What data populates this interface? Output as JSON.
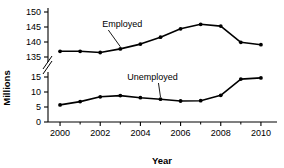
{
  "chart_data": {
    "type": "line",
    "title": "",
    "xlabel": "Year",
    "ylabel": "Millions",
    "grid": false,
    "legend_position": "inline-annotation",
    "x": [
      2000,
      2001,
      2002,
      2003,
      2004,
      2005,
      2006,
      2007,
      2008,
      2009,
      2010
    ],
    "xtick_labels": [
      "2000",
      "2002",
      "2004",
      "2006",
      "2008",
      "2010"
    ],
    "xtick_values": [
      2000,
      2002,
      2004,
      2006,
      2008,
      2010
    ],
    "xminor_values": [
      2001,
      2003,
      2005,
      2007,
      2009
    ],
    "xlim": [
      1999.4,
      2010.8
    ],
    "axis_break": true,
    "axis_break_between": [
      15,
      135
    ],
    "ytick_labels_lower": [
      "0",
      "5",
      "10",
      "15"
    ],
    "ytick_values_lower": [
      0,
      5,
      10,
      15
    ],
    "ytick_labels_upper": [
      "135",
      "140",
      "145",
      "150"
    ],
    "ytick_values_upper": [
      135,
      140,
      145,
      150
    ],
    "ylim_lower": [
      0,
      15
    ],
    "ylim_upper": [
      135,
      150
    ],
    "series": [
      {
        "name": "Employed",
        "scale": "upper",
        "values": [
          136.9,
          136.9,
          136.5,
          137.7,
          139.3,
          141.6,
          144.4,
          145.9,
          145.3,
          139.9,
          139.1
        ],
        "annotation": "Employed"
      },
      {
        "name": "Unemployed",
        "scale": "lower",
        "values": [
          5.7,
          6.8,
          8.4,
          8.8,
          8.1,
          7.6,
          7.0,
          7.1,
          8.9,
          14.3,
          14.7
        ],
        "annotation": "Unemployed"
      }
    ],
    "annotations": [
      {
        "text": "Employed",
        "series": "Employed",
        "label_x": 2003.1,
        "label_y_px": 27
      },
      {
        "text": "Unemployed",
        "series": "Unemployed",
        "label_x": 2004.6,
        "label_y_px": 80
      }
    ]
  }
}
